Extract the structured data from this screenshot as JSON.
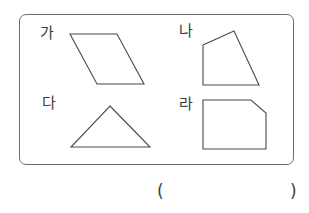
{
  "problem": {
    "shapes": [
      {
        "label": "가",
        "type": "parallelogram",
        "points": "70,34 117,34 144,84 97,84"
      },
      {
        "label": "나",
        "type": "quadrilateral",
        "points": "203,45 234,31 259,85 203,85"
      },
      {
        "label": "다",
        "type": "triangle",
        "points": "110,106 150,147 71,147"
      },
      {
        "label": "라",
        "type": "pentagon",
        "points": "203,100 251,100 266,113 266,149 203,149"
      }
    ],
    "answer": {
      "open": "(",
      "close": ")",
      "value": ""
    }
  },
  "colors": {
    "stroke": "#4a4a4a",
    "border": "#6e6e6e"
  }
}
